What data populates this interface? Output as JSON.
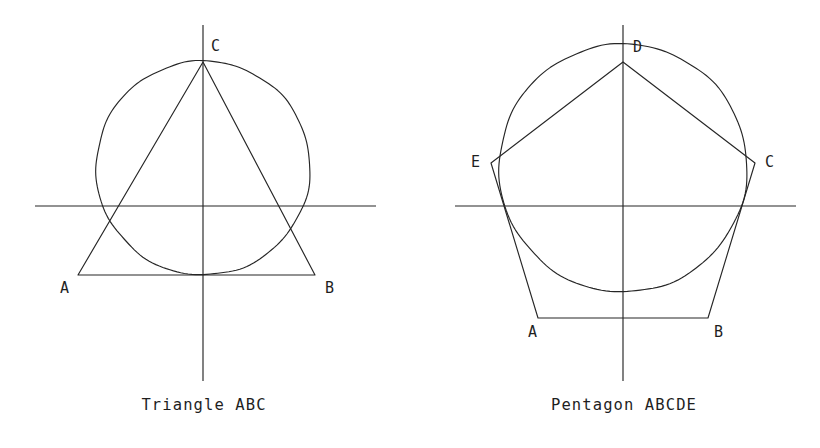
{
  "page": {
    "background_color": "#ffffff",
    "stroke_color": "#262626",
    "text_color": "#1f1f1f",
    "width": 820,
    "height": 448
  },
  "figures": [
    {
      "id": "triangle",
      "caption": "Triangle ABC",
      "caption_x": 204,
      "caption_y": 410,
      "circle": {
        "cx": 203,
        "cy": 168,
        "r": 107
      },
      "axes": {
        "horizontal": {
          "x1": 35,
          "y1": 206,
          "x2": 376,
          "y2": 206
        },
        "vertical": {
          "x1": 203,
          "y1": 25,
          "x2": 203,
          "y2": 381
        }
      },
      "polygon_points": "203,62 315,275 78,275",
      "vertices": [
        {
          "name": "A",
          "label": "A",
          "x": 78,
          "y": 275,
          "label_x": 60,
          "label_y": 293
        },
        {
          "name": "B",
          "label": "B",
          "x": 315,
          "y": 275,
          "label_x": 325,
          "label_y": 293
        },
        {
          "name": "C",
          "label": "C",
          "x": 203,
          "y": 62,
          "label_x": 211,
          "label_y": 51
        }
      ]
    },
    {
      "id": "pentagon",
      "caption": "Pentagon ABCDE",
      "caption_x": 624,
      "caption_y": 410,
      "circle": {
        "cx": 623,
        "cy": 168,
        "r": 124
      },
      "axes": {
        "horizontal": {
          "x1": 455,
          "y1": 206,
          "x2": 796,
          "y2": 206
        },
        "vertical": {
          "x1": 623,
          "y1": 25,
          "x2": 623,
          "y2": 381
        }
      },
      "polygon_points": "623,62 755,163 708,318 538,318 491,163",
      "vertices": [
        {
          "name": "A",
          "label": "A",
          "x": 538,
          "y": 318,
          "label_x": 528,
          "label_y": 337
        },
        {
          "name": "B",
          "label": "B",
          "x": 708,
          "y": 318,
          "label_x": 714,
          "label_y": 337
        },
        {
          "name": "C",
          "label": "C",
          "x": 755,
          "y": 163,
          "label_x": 765,
          "label_y": 167
        },
        {
          "name": "D",
          "label": "D",
          "x": 623,
          "y": 62,
          "label_x": 633,
          "label_y": 52
        },
        {
          "name": "E",
          "label": "E",
          "x": 491,
          "y": 163,
          "label_x": 471,
          "label_y": 167
        }
      ]
    }
  ]
}
